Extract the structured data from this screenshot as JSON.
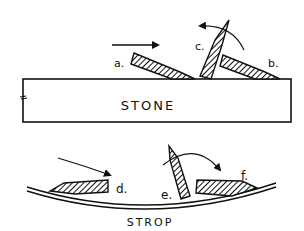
{
  "diagram": {
    "stone": {
      "label": "STONE"
    },
    "strop": {
      "label": "STROP"
    },
    "blades": [
      {
        "id": "a",
        "label": "a."
      },
      {
        "id": "b",
        "label": "b."
      },
      {
        "id": "c",
        "label": "c."
      },
      {
        "id": "d",
        "label": "d."
      },
      {
        "id": "e",
        "label": "e."
      },
      {
        "id": "f",
        "label": "f."
      }
    ],
    "colors": {
      "ink": "#111111",
      "background": "#ffffff"
    }
  }
}
